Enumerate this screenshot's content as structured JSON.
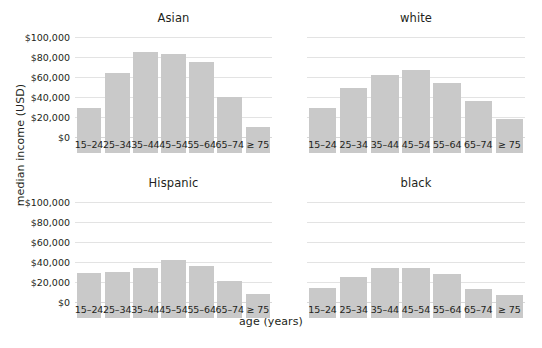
{
  "chart_data": {
    "type": "bar",
    "title": "",
    "xlabel": "age (years)",
    "ylabel": "median income (USD)",
    "ylim": [
      0,
      110000
    ],
    "yticks": [
      0,
      20000,
      40000,
      60000,
      80000,
      100000
    ],
    "ytick_labels": [
      "$0",
      "$20,000",
      "$40,000",
      "$60,000",
      "$80,000",
      "$100,000"
    ],
    "grid": true,
    "legend": "none",
    "categories": [
      "15–24",
      "25–34",
      "35–44",
      "45–54",
      "55–64",
      "65–74",
      "≥ 75"
    ],
    "facet_layout": "2x2",
    "panels": [
      {
        "title": "Asian",
        "position": "top-left",
        "values": [
          45000,
          80000,
          101000,
          99000,
          91000,
          56000,
          26000
        ]
      },
      {
        "title": "white",
        "position": "top-right",
        "values": [
          45000,
          65000,
          78000,
          83000,
          70000,
          52000,
          34000
        ]
      },
      {
        "title": "Hispanic",
        "position": "bottom-left",
        "values": [
          45000,
          46000,
          50000,
          58000,
          52000,
          37000,
          24000
        ]
      },
      {
        "title": "black",
        "position": "bottom-right",
        "values": [
          30000,
          41000,
          50000,
          50000,
          44000,
          29000,
          23000
        ]
      }
    ],
    "colors": {
      "bar_fill": "#c9c9c9",
      "gridline": "#e3e3e3",
      "text": "#231f20",
      "background": "#ffffff"
    }
  }
}
